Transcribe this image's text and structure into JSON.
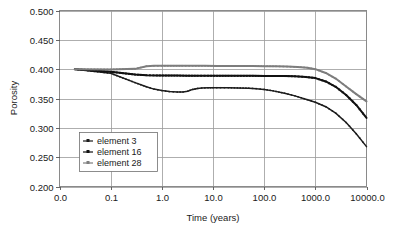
{
  "chart_data": {
    "type": "line",
    "title": "",
    "xlabel": "Time (years)",
    "ylabel": "Porosity",
    "xscale": "log-like categorical decades",
    "grid": true,
    "legend_position": "inside lower-left",
    "xlim": [
      0.0,
      10000.0
    ],
    "ylim": [
      0.2,
      0.5
    ],
    "x_tick_labels": [
      "0.0",
      "0.1",
      "1.0",
      "10.0",
      "100.0",
      "1000.0",
      "10000.0"
    ],
    "y_tick_labels": [
      "0.200",
      "0.250",
      "0.300",
      "0.350",
      "0.400",
      "0.450",
      "0.500"
    ],
    "y_ticks": [
      0.2,
      0.25,
      0.3,
      0.35,
      0.4,
      0.45,
      0.5
    ],
    "x_decade_positions": [
      0,
      1,
      2,
      3,
      4,
      5,
      6
    ],
    "series": [
      {
        "name": "element 3",
        "color": "#1c1c1c",
        "marker": "small-square",
        "x": [
          0.02,
          0.1,
          0.3,
          0.5,
          0.7,
          1.0,
          1.4,
          2.0,
          2.6,
          3.2,
          4.0,
          5.0,
          6.0,
          8.0,
          10.0,
          14.0,
          20.0,
          30.0,
          50.0,
          70.0,
          100.0,
          150.0,
          250.0,
          400.0,
          700.0,
          1000.0,
          1600.0,
          2500.0,
          4000.0,
          6300.0,
          10000.0
        ],
        "y": [
          0.4,
          0.393,
          0.377,
          0.37,
          0.366,
          0.3635,
          0.3618,
          0.361,
          0.3612,
          0.3625,
          0.3655,
          0.3672,
          0.3678,
          0.3682,
          0.3684,
          0.3684,
          0.3683,
          0.3681,
          0.3676,
          0.3668,
          0.3655,
          0.363,
          0.359,
          0.3545,
          0.348,
          0.3435,
          0.336,
          0.325,
          0.309,
          0.29,
          0.268
        ]
      },
      {
        "name": "element 16",
        "color": "#111111",
        "marker": "square",
        "x": [
          0.02,
          0.1,
          0.3,
          0.5,
          0.8,
          1.2,
          2.0,
          3.0,
          5.0,
          8.0,
          12.0,
          20.0,
          35.0,
          60.0,
          100.0,
          160.0,
          260.0,
          400.0,
          650.0,
          1000.0,
          1600.0,
          2500.0,
          4000.0,
          6300.0,
          10000.0
        ],
        "y": [
          0.4,
          0.3955,
          0.3908,
          0.3897,
          0.3893,
          0.3891,
          0.389,
          0.3889,
          0.3888,
          0.3888,
          0.3887,
          0.3887,
          0.3886,
          0.3886,
          0.3885,
          0.3884,
          0.3882,
          0.3878,
          0.3868,
          0.3848,
          0.379,
          0.37,
          0.356,
          0.339,
          0.317
        ]
      },
      {
        "name": "element 28",
        "color": "#7d7d7d",
        "marker": "cross",
        "x": [
          0.02,
          0.1,
          0.3,
          0.5,
          0.7,
          1.0,
          1.5,
          2.5,
          4.0,
          7.0,
          12.0,
          20.0,
          35.0,
          60.0,
          100.0,
          170.0,
          280.0,
          450.0,
          700.0,
          1000.0,
          1600.0,
          2500.0,
          4000.0,
          6300.0,
          10000.0
        ],
        "y": [
          0.4,
          0.3995,
          0.4005,
          0.405,
          0.4057,
          0.4058,
          0.4058,
          0.4058,
          0.4057,
          0.4057,
          0.4056,
          0.4055,
          0.4054,
          0.4053,
          0.4051,
          0.4048,
          0.4044,
          0.4038,
          0.4025,
          0.4,
          0.3935,
          0.384,
          0.3705,
          0.3575,
          0.345
        ]
      }
    ]
  },
  "legend": {
    "entries": [
      {
        "label": "element 3"
      },
      {
        "label": "element 16"
      },
      {
        "label": "element 28"
      }
    ]
  }
}
